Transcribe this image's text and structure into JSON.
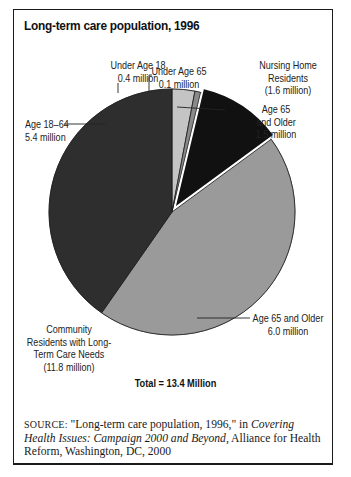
{
  "figure": {
    "header_label": "FIGURE 3.6",
    "title": "Long-term care population, 1996",
    "total_label": "Total = 13.4 Million",
    "source": {
      "prefix": "SOURCE:",
      "text_before": " \"Long-term care population, 1996,\" in ",
      "italic": "Covering Health Issues: Campaign 2000 and Beyond,",
      "text_after": " Alliance for Health Reform, Washington, DC, 2000"
    }
  },
  "labels": {
    "under18": [
      "Under Age 18",
      "0.4 million"
    ],
    "under65": [
      "Under Age 65",
      "0.1 million"
    ],
    "nh_group": [
      "Nursing Home",
      "Residents",
      "(1.6 million)"
    ],
    "nh65": [
      "Age 65",
      "and Older",
      "1.5 million"
    ],
    "age1864": [
      "Age 18–64",
      "5.4 million"
    ],
    "comm65": [
      "Age 65 and Older",
      "6.0 million"
    ],
    "comm_group": [
      "Community",
      "Residents with Long-",
      "Term Care Needs",
      "(11.8 million)"
    ]
  },
  "chart_data": {
    "type": "pie",
    "title": "Long-term care population, 1996",
    "units": "million people",
    "total": 13.4,
    "total_label": "Total = 13.4 Million",
    "groups": [
      {
        "name": "Nursing Home Residents",
        "total": 1.6,
        "members": [
          "Under Age 65 (Nursing Home)",
          "Age 65 and Older (Nursing Home)"
        ]
      },
      {
        "name": "Community Residents with Long-Term Care Needs",
        "total": 11.8,
        "members": [
          "Under Age 18",
          "Age 18–64",
          "Age 65 and Older (Community)"
        ]
      }
    ],
    "slices": [
      {
        "label": "Under Age 18",
        "group": "Community Residents with Long-Term Care Needs",
        "value": 0.4,
        "color": "#c4c4c4"
      },
      {
        "label": "Under Age 65",
        "group": "Nursing Home Residents",
        "value": 0.1,
        "color": "#8a8a8a"
      },
      {
        "label": "Age 65 and Older",
        "group": "Nursing Home Residents",
        "value": 1.5,
        "color": "#111111",
        "exploded": true
      },
      {
        "label": "Age 65 and Older",
        "group": "Community Residents with Long-Term Care Needs",
        "value": 6.0,
        "color": "#9a9a9a"
      },
      {
        "label": "Age 18–64",
        "group": "Community Residents with Long-Term Care Needs",
        "value": 5.4,
        "color": "#2e2e2e"
      }
    ],
    "start_angle_deg": 0,
    "direction": "clockwise",
    "legend": "none (direct labels)"
  }
}
